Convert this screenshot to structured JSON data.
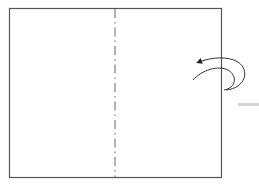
{
  "diagram": {
    "type": "origami-fold-instruction",
    "paper": {
      "x": 9,
      "y": 8,
      "width": 212,
      "height": 169,
      "stroke": "#555555"
    },
    "fold_line": {
      "style": "mountain-fold (dash-dot)",
      "x": 115,
      "y1": 8,
      "y2": 177,
      "stroke": "#666666"
    },
    "arrow": {
      "meaning": "fold right half behind / over to the left",
      "stroke": "#333333"
    },
    "side_mark": {
      "x": 238,
      "y": 103,
      "width": 21,
      "height": 3,
      "color": "#d4d4d4"
    },
    "labels": []
  }
}
